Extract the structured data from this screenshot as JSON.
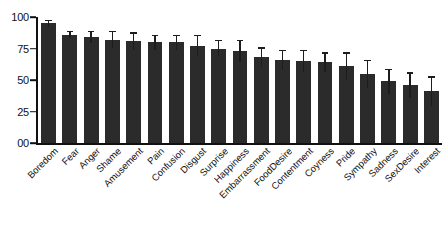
{
  "chart_data": {
    "type": "bar",
    "title": "",
    "subtitle": "",
    "xlabel": "",
    "ylabel": "",
    "ylim": [
      0,
      100
    ],
    "grid": false,
    "legend": false,
    "legend_position": "none",
    "bar_color": "#2b2b2b",
    "error_bar_color": "#1d1d1d",
    "y_ticks": [
      "00",
      "25",
      "50",
      "75",
      "100"
    ],
    "y_tick_values": [
      0,
      25,
      50,
      75,
      100
    ],
    "categories": [
      "Boredom",
      "Fear",
      "Anger",
      "Shame",
      "Amusement",
      "Pain",
      "Confusion",
      "Disgust",
      "Surprise",
      "Happiness",
      "Embarrassment",
      "FoodDesire",
      "Contentment",
      "Coyness",
      "Pride",
      "Sympathy",
      "Sadness",
      "SexDesire",
      "Interest"
    ],
    "values": [
      95,
      86,
      84,
      82,
      81,
      80,
      80,
      77,
      75,
      73,
      68,
      66,
      65,
      64,
      61,
      55,
      49,
      46,
      41
    ],
    "errors_upper": [
      3,
      3,
      5,
      7,
      7,
      6,
      6,
      9,
      7,
      9,
      8,
      8,
      9,
      8,
      11,
      11,
      10,
      10,
      12
    ],
    "errors_lower": [
      3,
      3,
      5,
      7,
      7,
      6,
      6,
      9,
      7,
      9,
      8,
      8,
      9,
      8,
      11,
      11,
      10,
      10,
      12
    ]
  }
}
